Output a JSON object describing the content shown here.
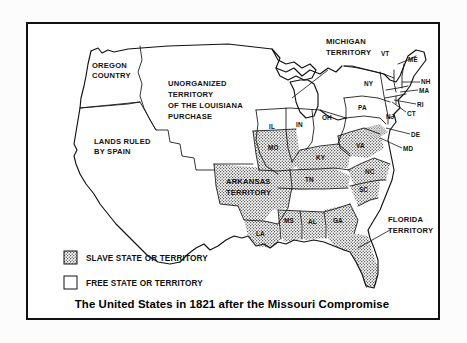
{
  "document": {
    "type": "historical-map",
    "title": "The United States in 1821 after the Missouri Compromise"
  },
  "legend": {
    "items": [
      {
        "label": "SLAVE STATE OR TERRITORY",
        "swatch": "stippled"
      },
      {
        "label": "FREE STATE OR TERRITORY",
        "swatch": "white"
      }
    ]
  },
  "regions": [
    {
      "name": "oregon-country",
      "label_lines": [
        "OREGON",
        "COUNTRY"
      ],
      "status": "free"
    },
    {
      "name": "unorganized-territory",
      "label_lines": [
        "UNORGANIZED",
        "TERRITORY",
        "OF THE LOUISIANA",
        "PURCHASE"
      ],
      "status": "free"
    },
    {
      "name": "lands-ruled-by-spain",
      "label_lines": [
        "LANDS RULED",
        "BY SPAIN"
      ],
      "status": "none"
    },
    {
      "name": "michigan-territory",
      "label_lines": [
        "MICHIGAN",
        "TERRITORY"
      ],
      "status": "free"
    },
    {
      "name": "arkansas-territory",
      "label_lines": [
        "ARKANSAS",
        "TERRITORY"
      ],
      "status": "slave"
    },
    {
      "name": "florida-territory",
      "label_lines": [
        "FLORIDA",
        "TERRITORY"
      ],
      "status": "slave"
    }
  ],
  "states": [
    {
      "abbr": "VT",
      "status": "free"
    },
    {
      "abbr": "ME",
      "status": "free"
    },
    {
      "abbr": "NH",
      "status": "free"
    },
    {
      "abbr": "MA",
      "status": "free"
    },
    {
      "abbr": "RI",
      "status": "free"
    },
    {
      "abbr": "CT",
      "status": "free"
    },
    {
      "abbr": "NY",
      "status": "free"
    },
    {
      "abbr": "PA",
      "status": "free"
    },
    {
      "abbr": "NJ",
      "status": "free"
    },
    {
      "abbr": "DE",
      "status": "slave"
    },
    {
      "abbr": "MD",
      "status": "slave"
    },
    {
      "abbr": "OH",
      "status": "free"
    },
    {
      "abbr": "IN",
      "status": "free"
    },
    {
      "abbr": "IL",
      "status": "free"
    },
    {
      "abbr": "MO",
      "status": "slave"
    },
    {
      "abbr": "KY",
      "status": "slave"
    },
    {
      "abbr": "VA",
      "status": "slave"
    },
    {
      "abbr": "TN",
      "status": "slave"
    },
    {
      "abbr": "NC",
      "status": "slave"
    },
    {
      "abbr": "SC",
      "status": "slave"
    },
    {
      "abbr": "GA",
      "status": "slave"
    },
    {
      "abbr": "AL",
      "status": "slave"
    },
    {
      "abbr": "MS",
      "status": "slave"
    },
    {
      "abbr": "LA",
      "status": "slave"
    }
  ],
  "labels": {
    "oregon_1": "OREGON",
    "oregon_2": "COUNTRY",
    "unorg_1": "UNORGANIZED",
    "unorg_2": "TERRITORY",
    "unorg_3": "OF THE LOUISIANA",
    "unorg_4": "PURCHASE",
    "spain_1": "LANDS RULED",
    "spain_2": "BY SPAIN",
    "michigan_1": "MICHIGAN",
    "michigan_2": "TERRITORY",
    "arkansas_1": "ARKANSAS",
    "arkansas_2": "TERRITORY",
    "florida_1": "FLORIDA",
    "florida_2": "TERRITORY",
    "VT": "VT",
    "ME": "ME",
    "NH": "NH",
    "MA": "MA",
    "RI": "RI",
    "CT": "CT",
    "NY": "NY",
    "PA": "PA",
    "NJ": "NJ",
    "DE": "DE",
    "MD": "MD",
    "OH": "OH",
    "IN": "IN",
    "IL": "IL",
    "MO": "MO",
    "KY": "KY",
    "VA": "VA",
    "TN": "TN",
    "NC": "NC",
    "SC": "SC",
    "GA": "GA",
    "AL": "AL",
    "MS": "MS",
    "LA": "LA",
    "legend_slave": "SLAVE STATE OR TERRITORY",
    "legend_free": "FREE STATE OR TERRITORY",
    "title": "The United States in 1821 after the Missouri Compromise"
  },
  "colors": {
    "ink": "#111111",
    "page": "#fcfcfc",
    "map_background": "#ffffff",
    "stipple": "#333333"
  }
}
